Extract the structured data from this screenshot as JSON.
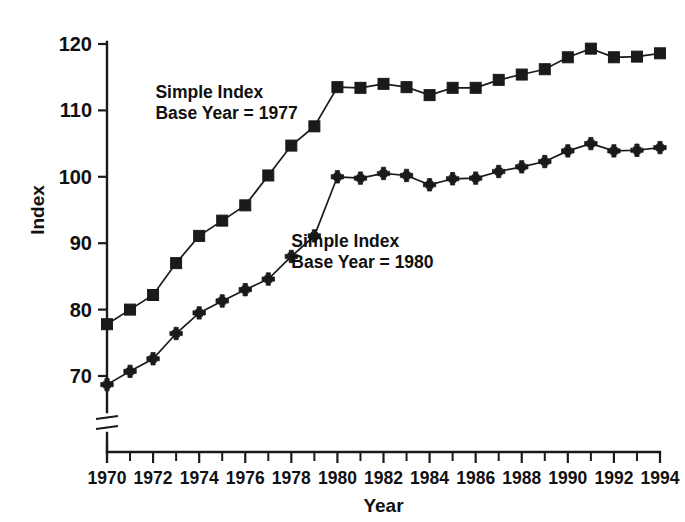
{
  "chart_data": {
    "type": "line",
    "title": "",
    "xlabel": "Year",
    "ylabel": "Index",
    "xlim": [
      1970,
      1994
    ],
    "ylim": [
      66,
      122
    ],
    "grid": false,
    "axis_break": true,
    "legend_position": "inline-annotations",
    "x": [
      1970,
      1971,
      1972,
      1973,
      1974,
      1975,
      1976,
      1977,
      1978,
      1979,
      1980,
      1981,
      1982,
      1983,
      1984,
      1985,
      1986,
      1987,
      1988,
      1989,
      1990,
      1991,
      1992,
      1993,
      1994
    ],
    "xtick_labels": [
      "1970",
      "1972",
      "1974",
      "1976",
      "1978",
      "1980",
      "1982",
      "1984",
      "1986",
      "1988",
      "1990",
      "1992",
      "1994"
    ],
    "xtick_values": [
      1970,
      1972,
      1974,
      1976,
      1978,
      1980,
      1982,
      1984,
      1986,
      1988,
      1990,
      1992,
      1994
    ],
    "ytick_labels": [
      "70",
      "80",
      "90",
      "100",
      "110",
      "120"
    ],
    "ytick_values": [
      70,
      80,
      90,
      100,
      110,
      120
    ],
    "series": [
      {
        "name": "Simple Index Base Year = 1977",
        "label_line1": "Simple Index",
        "label_line2": "Base Year = 1977",
        "marker": "square",
        "color": "#1a1a1a",
        "values": [
          77.8,
          80.0,
          82.2,
          87.0,
          91.1,
          93.4,
          95.7,
          100.2,
          104.7,
          107.6,
          113.5,
          113.4,
          114.0,
          113.5,
          112.3,
          113.4,
          113.4,
          114.6,
          115.4,
          116.2,
          118.0,
          119.3,
          118.0,
          118.1,
          118.6
        ]
      },
      {
        "name": "Simple Index Base Year = 1980",
        "label_line1": "Simple Index",
        "label_line2": "Base Year = 1980",
        "marker": "plus",
        "color": "#1a1a1a",
        "values": [
          68.7,
          70.7,
          72.6,
          76.4,
          79.5,
          81.3,
          83.0,
          84.6,
          88.0,
          91.1,
          100.0,
          99.8,
          100.5,
          100.2,
          98.8,
          99.7,
          99.8,
          100.8,
          101.5,
          102.3,
          103.9,
          105.0,
          103.9,
          104.0,
          104.4
        ]
      }
    ],
    "series_label_positions": [
      {
        "x": 1972.1,
        "y": 111.8
      },
      {
        "x": 1978.0,
        "y": 89.4
      }
    ]
  }
}
